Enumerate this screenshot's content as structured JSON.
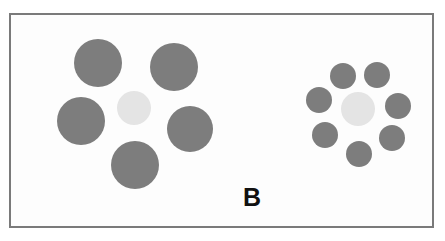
{
  "figure": {
    "panel_label": "B",
    "width": 445,
    "height": 241,
    "background_color": "#ffffff",
    "frame": {
      "x": 9,
      "y": 13,
      "width": 425,
      "height": 215,
      "border_color": "#7a7a7a",
      "border_width": 2,
      "fill_color": "#fdfdfd"
    },
    "label_style": {
      "x": 241,
      "y": 183,
      "font_size": 25,
      "color": "#111111"
    },
    "colors": {
      "inducer_gray": "#7d7d7d",
      "target_light_gray": "#e4e4e4",
      "frame_gray": "#7a7a7a",
      "label_black": "#111111"
    },
    "clusters": [
      {
        "name": "left-cluster-large-inducers",
        "target": {
          "name": "target-circle-left",
          "cx": 132,
          "cy": 106,
          "r": 17,
          "color": "#e4e4e4"
        },
        "inducers": [
          {
            "name": "inducer-left-top-left",
            "cx": 96,
            "cy": 61,
            "r": 24,
            "color": "#7d7d7d"
          },
          {
            "name": "inducer-left-top-right",
            "cx": 172,
            "cy": 65,
            "r": 24,
            "color": "#7d7d7d"
          },
          {
            "name": "inducer-left-mid-left",
            "cx": 79,
            "cy": 119,
            "r": 24,
            "color": "#7d7d7d"
          },
          {
            "name": "inducer-left-mid-right",
            "cx": 188,
            "cy": 127,
            "r": 23,
            "color": "#7d7d7d"
          },
          {
            "name": "inducer-left-bottom",
            "cx": 133,
            "cy": 163,
            "r": 24,
            "color": "#7d7d7d"
          }
        ]
      },
      {
        "name": "right-cluster-small-inducers",
        "target": {
          "name": "target-circle-right",
          "cx": 356,
          "cy": 107,
          "r": 17,
          "color": "#e4e4e4"
        },
        "inducers": [
          {
            "name": "inducer-right-top-left",
            "cx": 341,
            "cy": 74,
            "r": 13,
            "color": "#7d7d7d"
          },
          {
            "name": "inducer-right-top-right",
            "cx": 375,
            "cy": 73,
            "r": 13,
            "color": "#7d7d7d"
          },
          {
            "name": "inducer-right-upper-left",
            "cx": 317,
            "cy": 98,
            "r": 13,
            "color": "#7d7d7d"
          },
          {
            "name": "inducer-right-upper-right",
            "cx": 396,
            "cy": 104,
            "r": 13,
            "color": "#7d7d7d"
          },
          {
            "name": "inducer-right-lower-left",
            "cx": 323,
            "cy": 133,
            "r": 13,
            "color": "#7d7d7d"
          },
          {
            "name": "inducer-right-lower-right",
            "cx": 390,
            "cy": 136,
            "r": 13,
            "color": "#7d7d7d"
          },
          {
            "name": "inducer-right-bottom",
            "cx": 357,
            "cy": 152,
            "r": 13,
            "color": "#7d7d7d"
          }
        ]
      }
    ]
  }
}
